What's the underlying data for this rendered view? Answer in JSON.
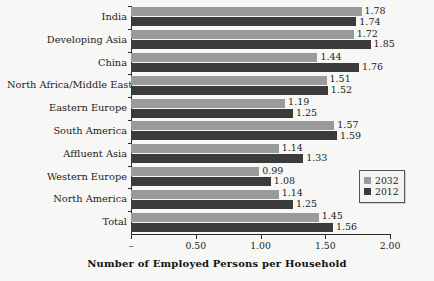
{
  "chart_data": {
    "type": "bar",
    "orientation": "horizontal",
    "title": "",
    "xlabel": "Number of Employed Persons per Household",
    "ylabel": "",
    "xlim": [
      0,
      2.0
    ],
    "xticks": [
      "–",
      "0.50",
      "1.00",
      "1.50",
      "2.00"
    ],
    "xtick_values": [
      0,
      0.5,
      1.0,
      1.5,
      2.0
    ],
    "grid": false,
    "legend_position": "center-right",
    "categories": [
      "India",
      "Developing Asia",
      "China",
      "North Africa/Middle East",
      "Eastern Europe",
      "South America",
      "Affluent Asia",
      "Western Europe",
      "North America",
      "Total"
    ],
    "series": [
      {
        "name": "2032",
        "color": "#9a9a9a",
        "values": [
          1.78,
          1.72,
          1.44,
          1.51,
          1.19,
          1.57,
          1.14,
          0.99,
          1.14,
          1.45
        ],
        "labels": [
          "1.78",
          "1.72",
          "1.44",
          "1.51",
          "1.19",
          "1.57",
          "1.14",
          "0.99",
          "1.14",
          "1.45"
        ]
      },
      {
        "name": "2012",
        "color": "#3b3b3b",
        "values": [
          1.74,
          1.85,
          1.76,
          1.52,
          1.25,
          1.59,
          1.33,
          1.08,
          1.25,
          1.56
        ],
        "labels": [
          "1.74",
          "1.85",
          "1.76",
          "1.52",
          "1.25",
          "1.59",
          "1.33",
          "1.08",
          "1.25",
          "1.56"
        ]
      }
    ]
  },
  "legend": {
    "items": [
      {
        "label": "2032",
        "color": "#9a9a9a"
      },
      {
        "label": "2012",
        "color": "#3b3b3b"
      }
    ]
  }
}
